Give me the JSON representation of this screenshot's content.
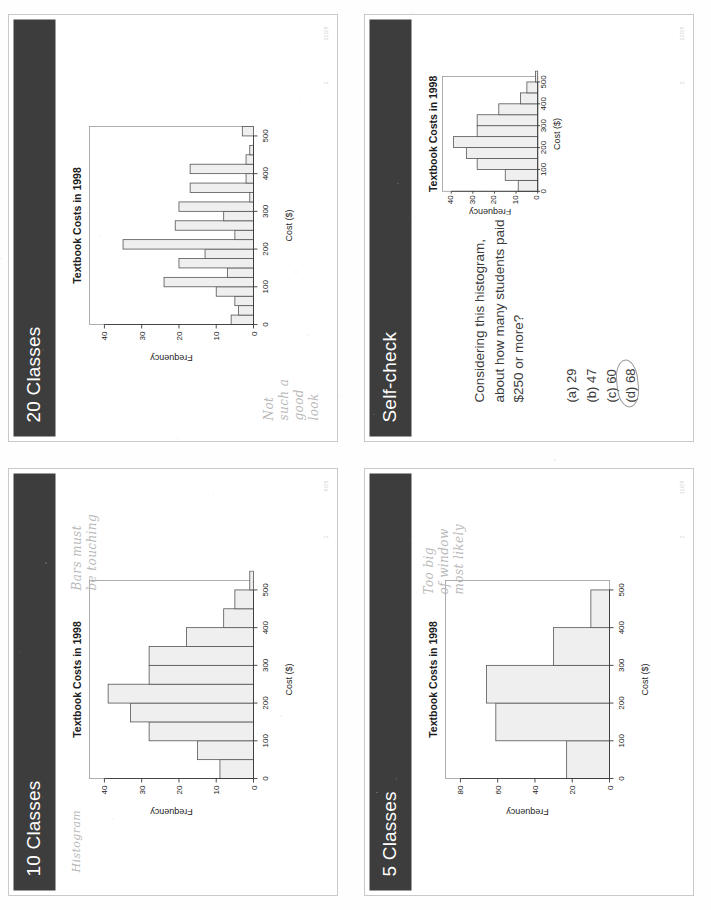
{
  "document": {
    "kind": "scanned-lecture-handout",
    "slides_per_page": 4
  },
  "slides": [
    {
      "id": "slide-20-classes",
      "position": "top-left",
      "title": "20 Classes",
      "footer": {
        "dots": "· · · · · · · · · · ·",
        "page": "2",
        "stamp": "10/29"
      },
      "handwriting": "Not\nsuch a\ngood\nlook",
      "chart_ref": 0
    },
    {
      "id": "slide-self-check",
      "position": "top-right",
      "title": "Self-check",
      "footer": {
        "dots": "· · · · · · · · · · ·",
        "page": "2",
        "stamp": "12/29"
      },
      "question": "Considering this histogram, about how many students paid $250 or more?",
      "options": [
        {
          "key": "(a)",
          "value": "29",
          "circled": false
        },
        {
          "key": "(b)",
          "value": "47",
          "circled": false
        },
        {
          "key": "(c)",
          "value": "60",
          "circled": false
        },
        {
          "key": "(d)",
          "value": "68",
          "circled": true
        }
      ],
      "chart_ref": 3
    },
    {
      "id": "slide-10-classes",
      "position": "bottom-left",
      "title": "10 Classes",
      "footer": {
        "dots": "· · · · · · · · · · ·",
        "page": "2",
        "stamp": "9/29"
      },
      "handwriting": "Bars must\nbe touching",
      "handwriting2": "Histogram",
      "chart_ref": 1
    },
    {
      "id": "slide-5-classes",
      "position": "bottom-right",
      "title": "5 Classes",
      "footer": {
        "dots": "· · · · · · · · · · ·",
        "page": "2",
        "stamp": "11/29"
      },
      "handwriting": "Too big\nof window\nmost likely",
      "chart_ref": 2
    }
  ],
  "chart_data": [
    {
      "id": "hist-20-classes",
      "type": "bar",
      "title": "Textbook Costs in 1998",
      "xlabel": "Cost ($)",
      "ylabel": "Frequency",
      "xlim": [
        0,
        525
      ],
      "ylim": [
        0,
        44
      ],
      "xticks": [
        0,
        100,
        200,
        300,
        400,
        500
      ],
      "yticks": [
        0,
        10,
        20,
        30,
        40
      ],
      "bin_width": 25,
      "bin_starts": [
        0,
        25,
        50,
        75,
        100,
        125,
        150,
        175,
        200,
        225,
        250,
        275,
        300,
        325,
        350,
        375,
        400,
        425,
        450,
        475,
        500
      ],
      "values": [
        6,
        4,
        5,
        10,
        24,
        7,
        20,
        13,
        35,
        5,
        21,
        8,
        20,
        1,
        17,
        2,
        17,
        2,
        1,
        0,
        3
      ],
      "grid": false
    },
    {
      "id": "hist-10-classes",
      "type": "bar",
      "title": "Textbook Costs in 1998",
      "xlabel": "Cost ($)",
      "ylabel": "Frequency",
      "xlim": [
        0,
        525
      ],
      "ylim": [
        0,
        44
      ],
      "xticks": [
        0,
        100,
        200,
        300,
        400,
        500
      ],
      "yticks": [
        0,
        10,
        20,
        30,
        40
      ],
      "bin_width": 50,
      "bin_starts": [
        0,
        50,
        100,
        150,
        200,
        250,
        300,
        350,
        400,
        450,
        500
      ],
      "values": [
        9,
        15,
        28,
        33,
        39,
        28,
        28,
        18,
        8,
        5,
        1
      ],
      "grid": false
    },
    {
      "id": "hist-5-classes",
      "type": "bar",
      "title": "Textbook Costs in 1998",
      "xlabel": "Cost ($)",
      "ylabel": "Frequency",
      "xlim": [
        0,
        525
      ],
      "ylim": [
        0,
        88
      ],
      "xticks": [
        0,
        100,
        200,
        300,
        400,
        500
      ],
      "yticks": [
        0,
        20,
        40,
        60,
        80
      ],
      "bin_width": 100,
      "bin_starts": [
        0,
        100,
        200,
        300,
        400
      ],
      "values": [
        23,
        61,
        66,
        30,
        10
      ],
      "grid": false
    },
    {
      "id": "hist-self-check",
      "type": "bar",
      "title": "Textbook Costs in 1998",
      "xlabel": "Cost ($)",
      "ylabel": "Frequency",
      "xlim": [
        0,
        525
      ],
      "ylim": [
        0,
        44
      ],
      "xticks": [
        0,
        100,
        200,
        300,
        400,
        500
      ],
      "yticks": [
        0,
        10,
        20,
        30,
        40
      ],
      "bin_width": 50,
      "bin_starts": [
        0,
        50,
        100,
        150,
        200,
        250,
        300,
        350,
        400,
        450,
        500
      ],
      "values": [
        9,
        15,
        28,
        33,
        39,
        28,
        28,
        18,
        8,
        5,
        1
      ],
      "grid": false
    }
  ],
  "colors": {
    "header_band": "#3d3d3d",
    "header_text": "#ffffff",
    "bar_fill": "#efefef",
    "bar_stroke": "#555555",
    "handwriting": "#b9b9b9",
    "page_bg": "#ffffff"
  }
}
